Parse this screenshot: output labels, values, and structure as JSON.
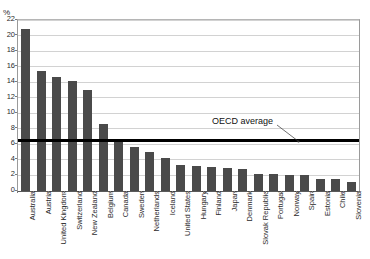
{
  "figure": {
    "unit_label": "%",
    "title_remnant": "",
    "annotation": {
      "label": "OECD average",
      "value": 6.5
    }
  },
  "colors": {
    "bar_fill": "#4a4a4a",
    "average_line": "#000000",
    "gridline": "#d2d2d2",
    "axis": "#5a5a5a",
    "text": "#2b2b2b",
    "background": "#ffffff"
  },
  "chart_data": {
    "type": "bar",
    "title": "",
    "subtitle": "",
    "xlabel": "",
    "ylabel": "%",
    "ylim": [
      0,
      22
    ],
    "ytick_step": 2,
    "yticks": [
      0,
      2,
      4,
      6,
      8,
      10,
      12,
      14,
      16,
      18,
      20,
      22
    ],
    "ytick_labels": [
      "0",
      "2",
      "4",
      "6",
      "8",
      "10",
      "12",
      "14",
      "16",
      "18",
      "20",
      "22"
    ],
    "grid": true,
    "grid_axis": "y",
    "legend": false,
    "legend_position": "none",
    "orientation": "vertical",
    "sorted": "descending",
    "categories": [
      "Australia",
      "Austria",
      "United Kingdom",
      "Switzerland",
      "New Zealand",
      "Belgium",
      "Canada",
      "Sweden",
      "Netherlands",
      "Iceland",
      "United States",
      "Hungary",
      "Finland",
      "Japan",
      "Denmark",
      "Slovak Republic",
      "Portugal",
      "Norway",
      "Spain",
      "Estonia",
      "Chile",
      "Slovenia"
    ],
    "values": [
      20.8,
      15.5,
      14.7,
      14.1,
      13.0,
      8.6,
      6.6,
      5.6,
      5.0,
      4.3,
      3.4,
      3.2,
      3.1,
      3.0,
      2.8,
      2.2,
      2.2,
      2.1,
      2.1,
      1.5,
      1.5,
      1.2
    ],
    "annotations": [
      {
        "type": "hline",
        "label": "OECD average",
        "value": 6.5
      }
    ]
  }
}
